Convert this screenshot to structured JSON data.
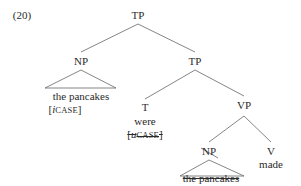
{
  "example_number": "(20)",
  "tree": {
    "root": {
      "label": "TP"
    },
    "subject": {
      "label": "NP",
      "text": "the pancakes",
      "feature": {
        "open": "[",
        "prefix": "i",
        "name": "CASE",
        "close": "]"
      }
    },
    "tp_bar": {
      "label": "TP"
    },
    "t": {
      "label": "T",
      "word": "were",
      "feature": {
        "open": "[",
        "prefix": "u",
        "name": "CASE",
        "close": "]",
        "struck": true
      }
    },
    "vp": {
      "label": "VP"
    },
    "object": {
      "label": "NP",
      "text": "the pancakes",
      "struck": true
    },
    "v": {
      "label": "V",
      "word": "made"
    }
  },
  "colors": {
    "ink": "#2a2a2a",
    "line": "#555555",
    "background": "#ffffff"
  }
}
